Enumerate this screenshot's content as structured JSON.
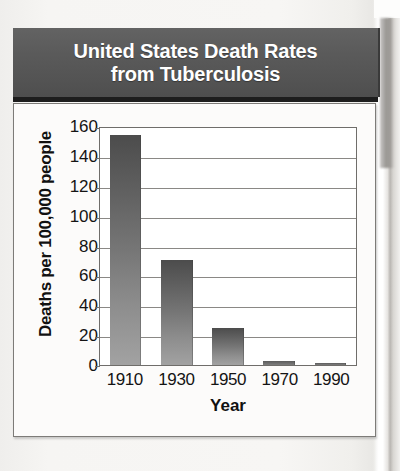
{
  "banner": {
    "title_line1": "United States Death Rates",
    "title_line2": "from Tuberculosis",
    "background_color": "#5a5a5a",
    "text_color": "#ffffff"
  },
  "chart_data": {
    "type": "bar",
    "title": "United States Death Rates from Tuberculosis",
    "categories": [
      "1910",
      "1930",
      "1950",
      "1970",
      "1990"
    ],
    "values": [
      154,
      70,
      25,
      3,
      1
    ],
    "xlabel": "Year",
    "ylabel": "Deaths per 100,000 people",
    "ylim": [
      0,
      160
    ],
    "ytick_values": [
      0,
      20,
      40,
      60,
      80,
      100,
      120,
      140,
      160
    ],
    "ytick_labels": [
      "0",
      "20",
      "40",
      "60",
      "80",
      "100",
      "120",
      "140",
      "160"
    ],
    "grid": true,
    "legend": "none",
    "bar_color_top": "#4c4c4c",
    "bar_color_bottom": "#a2a2a2"
  }
}
